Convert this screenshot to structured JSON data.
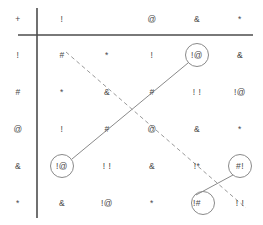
{
  "diagram": {
    "type": "symbol-grid-with-connectors",
    "width": 263,
    "height": 225,
    "colors": {
      "axis": "#4d4d4d",
      "text": "#4a4a4a",
      "solid_line": "#8a8a8a",
      "dashed_line": "#9a9a9a",
      "circle_stroke": "#8a8a8a",
      "background": "#ffffff"
    },
    "axes": {
      "vertical_x": 37,
      "horizontal_y": 35
    },
    "geometry": {
      "col_x": [
        18,
        62,
        107,
        152,
        197,
        240
      ],
      "row_y": [
        19,
        55,
        92,
        129,
        166,
        203
      ]
    },
    "header": {
      "label": "header-row",
      "cells": [
        "+",
        "!",
        "",
        "@",
        "&",
        "*"
      ]
    },
    "rows": [
      {
        "label": "!",
        "cells": [
          "#",
          "*",
          "!",
          "!@",
          "&"
        ]
      },
      {
        "label": "#",
        "cells": [
          "*",
          "&",
          "#",
          "! !",
          "!@"
        ]
      },
      {
        "label": "@",
        "cells": [
          "!",
          "#",
          "@",
          "&",
          "*"
        ]
      },
      {
        "label": "&",
        "cells": [
          "!@",
          "! !",
          "&",
          "!*",
          "#!"
        ]
      },
      {
        "label": "*",
        "cells": [
          "&",
          "!@",
          "*",
          "!#",
          "! !"
        ]
      }
    ],
    "circled_cells": [
      {
        "name": "circle-top-right",
        "text": "!@",
        "row": 0,
        "col": 4,
        "cx": 197,
        "cy": 55,
        "r": 12
      },
      {
        "name": "circle-bottom-left",
        "text": "!@",
        "row": 3,
        "col": 1,
        "cx": 62,
        "cy": 166,
        "r": 12
      },
      {
        "name": "circle-right-lower",
        "text": "#!",
        "row": 3,
        "col": 5,
        "cx": 240,
        "cy": 166,
        "r": 12
      },
      {
        "name": "circle-bottom-right",
        "text": "!#",
        "row": 4,
        "col": 4,
        "cx": 203,
        "cy": 203,
        "r": 12
      }
    ],
    "connectors": [
      {
        "name": "solid-connector-main",
        "style": "solid",
        "from": {
          "x": 72,
          "y": 159
        },
        "to": {
          "x": 188,
          "y": 63
        }
      },
      {
        "name": "solid-connector-corner",
        "style": "solid",
        "from": {
          "x": 196,
          "y": 195
        },
        "to": {
          "x": 233,
          "y": 175
        }
      },
      {
        "name": "dashed-connector-main",
        "style": "dashed",
        "from": {
          "x": 66,
          "y": 52
        },
        "to": {
          "x": 246,
          "y": 208
        }
      }
    ]
  }
}
